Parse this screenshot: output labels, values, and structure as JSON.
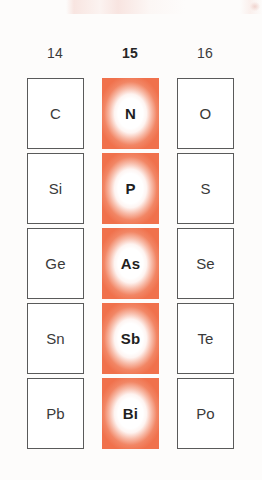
{
  "figure": {
    "kind": "periodic-table-excerpt",
    "highlight_color": "#f0714c",
    "box_border_color": "#5a5a5a",
    "text_color": "#3a3a3a",
    "background_color": "#fdfcfb"
  },
  "columns": [
    {
      "header": "14",
      "highlighted": false
    },
    {
      "header": "15",
      "highlighted": true
    },
    {
      "header": "16",
      "highlighted": false
    }
  ],
  "rows": [
    {
      "cells": [
        {
          "symbol": "C",
          "highlighted": false
        },
        {
          "symbol": "N",
          "highlighted": true
        },
        {
          "symbol": "O",
          "highlighted": false
        }
      ]
    },
    {
      "cells": [
        {
          "symbol": "Si",
          "highlighted": false
        },
        {
          "symbol": "P",
          "highlighted": true
        },
        {
          "symbol": "S",
          "highlighted": false
        }
      ]
    },
    {
      "cells": [
        {
          "symbol": "Ge",
          "highlighted": false
        },
        {
          "symbol": "As",
          "highlighted": true
        },
        {
          "symbol": "Se",
          "highlighted": false
        }
      ]
    },
    {
      "cells": [
        {
          "symbol": "Sn",
          "highlighted": false
        },
        {
          "symbol": "Sb",
          "highlighted": true
        },
        {
          "symbol": "Te",
          "highlighted": false
        }
      ]
    },
    {
      "cells": [
        {
          "symbol": "Pb",
          "highlighted": false
        },
        {
          "symbol": "Bi",
          "highlighted": true
        },
        {
          "symbol": "Po",
          "highlighted": false
        }
      ]
    }
  ]
}
